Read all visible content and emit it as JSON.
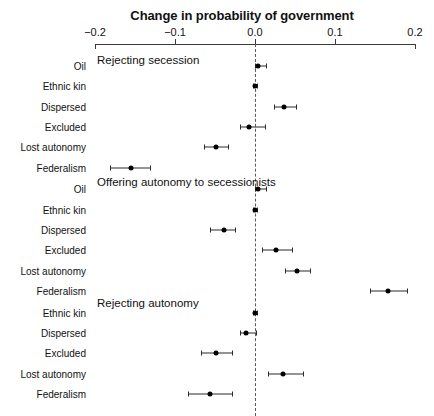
{
  "chart_data": {
    "type": "scatter",
    "title": "Change in probability of government",
    "xlabel": "",
    "ylabel": "",
    "xlim": [
      -0.2,
      0.2
    ],
    "xticks": [
      -0.2,
      -0.1,
      0.0,
      0.1,
      0.2
    ],
    "xtick_labels": [
      "−0.2",
      "−0.1",
      "0.0",
      "0.1",
      "0.2"
    ],
    "grid": false,
    "legend": "none",
    "reference_line": 0.0,
    "annotations": [
      "Rejecting secession",
      "Offering autonomy to secessionists",
      "Rejecting autonomy"
    ],
    "groups": [
      {
        "name": "Rejecting secession",
        "points": [
          {
            "label": "Oil",
            "value": 0.004,
            "low": 0.0,
            "high": 0.014
          },
          {
            "label": "Ethnic kin",
            "value": 0.0,
            "low": -0.002,
            "high": 0.002
          },
          {
            "label": "Dispersed",
            "value": 0.036,
            "low": 0.024,
            "high": 0.051
          },
          {
            "label": "Excluded",
            "value": -0.008,
            "low": -0.019,
            "high": 0.013
          },
          {
            "label": "Lost autonomy",
            "value": -0.049,
            "low": -0.064,
            "high": -0.034
          },
          {
            "label": "Federalism",
            "value": -0.155,
            "low": -0.181,
            "high": -0.131
          }
        ]
      },
      {
        "name": "Offering autonomy to secessionists",
        "points": [
          {
            "label": "Oil",
            "value": 0.004,
            "low": 0.0,
            "high": 0.014
          },
          {
            "label": "Ethnic kin",
            "value": 0.0,
            "low": -0.003,
            "high": 0.003
          },
          {
            "label": "Dispersed",
            "value": -0.039,
            "low": -0.056,
            "high": -0.025
          },
          {
            "label": "Excluded",
            "value": 0.026,
            "low": 0.009,
            "high": 0.046
          },
          {
            "label": "Lost autonomy",
            "value": 0.052,
            "low": 0.038,
            "high": 0.069
          },
          {
            "label": "Federalism",
            "value": 0.166,
            "low": 0.144,
            "high": 0.19
          }
        ]
      },
      {
        "name": "Rejecting autonomy",
        "points": [
          {
            "label": "Ethnic kin",
            "value": 0.0,
            "low": -0.003,
            "high": 0.003
          },
          {
            "label": "Dispersed",
            "value": -0.011,
            "low": -0.019,
            "high": 0.001
          },
          {
            "label": "Excluded",
            "value": -0.049,
            "low": -0.068,
            "high": -0.029
          },
          {
            "label": "Lost autonomy",
            "value": 0.035,
            "low": 0.016,
            "high": 0.06
          },
          {
            "label": "Federalism",
            "value": -0.056,
            "low": -0.084,
            "high": -0.029
          }
        ]
      }
    ]
  },
  "layout": {
    "x_zero_px": 255,
    "px_per_unit": 800,
    "plot_left_px": 95,
    "plot_right_px": 415,
    "group_label_x_px": 97,
    "rows": [
      {
        "group": 0,
        "index": 0,
        "y": 66
      },
      {
        "group": 0,
        "index": 1,
        "y": 86
      },
      {
        "group": 0,
        "index": 2,
        "y": 106
      },
      {
        "group": 0,
        "index": 3,
        "y": 126
      },
      {
        "group": 0,
        "index": 4,
        "y": 146
      },
      {
        "group": 0,
        "index": 5,
        "y": 167
      }
    ],
    "group_label_y": [
      54,
      176,
      297
    ]
  }
}
